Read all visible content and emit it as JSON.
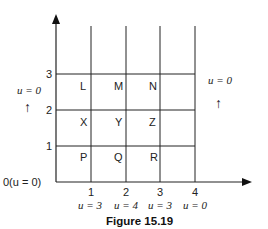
{
  "figure": {
    "caption": "Figure 15.19",
    "origin_label": "0(u = 0)",
    "y_ticks": [
      "1",
      "2",
      "3"
    ],
    "x_ticks": [
      "1",
      "2",
      "3",
      "4"
    ],
    "bottom_boundary": [
      "u = 3",
      "u = 4",
      "u = 3",
      "u = 0"
    ],
    "left_boundary": "u = 0",
    "right_boundary": "u = 0",
    "left_arrow": "↑",
    "right_arrow": "↑",
    "cells": {
      "row3": [
        "L",
        "M",
        "N"
      ],
      "row2": [
        "X",
        "Y",
        "Z"
      ],
      "row1": [
        "P",
        "Q",
        "R"
      ]
    }
  }
}
